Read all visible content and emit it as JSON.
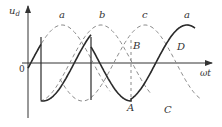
{
  "figure": {
    "axis_y_label": "u",
    "axis_y_subscript": "d",
    "axis_x_label": "ωt",
    "origin_label": "0",
    "phase_labels": [
      "a",
      "b",
      "c",
      "a"
    ],
    "point_labels": {
      "A": "A",
      "B": "B",
      "C": "C",
      "D": "D"
    },
    "colors": {
      "solid": "#2a2a2a",
      "dashed": "#8a8a8a",
      "axis": "#333333"
    }
  },
  "chart_data": {
    "type": "line",
    "title": "",
    "xlabel": "ωt",
    "ylabel": "u_d",
    "series": [
      {
        "name": "a (phase voltage, dashed)",
        "style": "dashed"
      },
      {
        "name": "b (phase voltage, dashed)",
        "style": "dashed"
      },
      {
        "name": "c (phase voltage, dashed)",
        "style": "dashed"
      },
      {
        "name": "u_d (output, solid)",
        "style": "solid"
      }
    ],
    "annotations": [
      "A",
      "B",
      "C",
      "D",
      "0"
    ],
    "grid": false
  }
}
